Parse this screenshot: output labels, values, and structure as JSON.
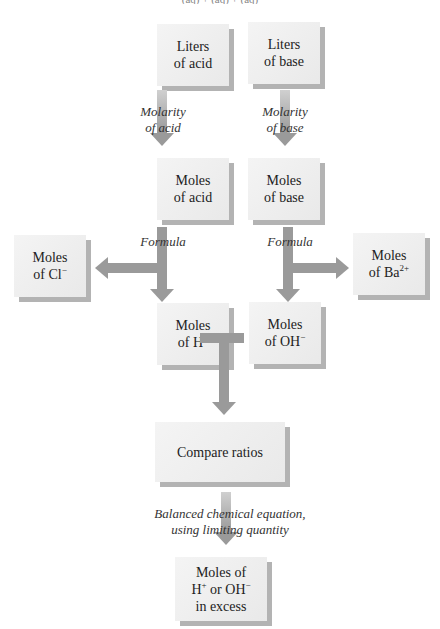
{
  "header_fragment": "(aq) + (aq) + (aq)",
  "boxes": {
    "liters_acid": "Liters\nof acid",
    "liters_base": "Liters\nof base",
    "moles_acid": "Moles\nof acid",
    "moles_base": "Moles\nof base",
    "moles_cl": {
      "line1": "Moles",
      "line2": "of Cl",
      "sup": "−"
    },
    "moles_ba": {
      "line1": "Moles",
      "line2": "of Ba",
      "sup": "2+"
    },
    "moles_h": {
      "line1": "Moles",
      "line2": "of H",
      "sup": "+"
    },
    "moles_oh": {
      "line1": "Moles",
      "line2": "of OH",
      "sup": "−"
    },
    "compare": "Compare ratios",
    "excess": {
      "line1": "Moles of",
      "line2a": "H",
      "sup1": "+",
      "line2b": " or OH",
      "sup2": "−",
      "line3": "in excess"
    }
  },
  "labels": {
    "molarity_acid": "Molarity\nof acid",
    "molarity_base": "Molarity\nof base",
    "formula_acid": "Formula",
    "formula_base": "Formula",
    "balanced": "Balanced chemical equation,\nusing limiting quantity"
  },
  "colors": {
    "arrow": "#9a9a9a",
    "box": "#eeeeee",
    "shadow": "#b3b3b3"
  }
}
